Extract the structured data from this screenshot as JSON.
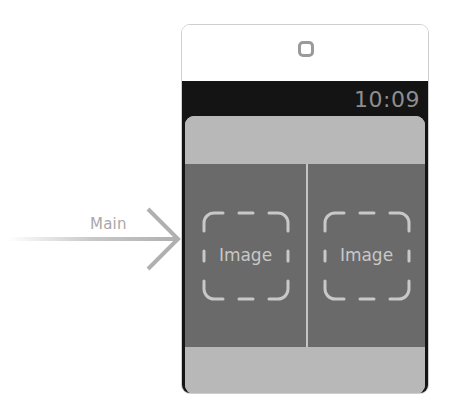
{
  "storyboard": {
    "entry_point": {
      "label": "Main",
      "icon": "entry-arrow-icon"
    },
    "interface_controller": {
      "scene_icon": "interface-controller-icon",
      "status_bar": {
        "time": "10:09"
      },
      "group": {
        "images": [
          {
            "label": "Image",
            "icon": "image-placeholder-icon"
          },
          {
            "label": "Image",
            "icon": "image-placeholder-icon"
          }
        ]
      }
    }
  },
  "colors": {
    "screen_background": "#141414",
    "group_background": "#b8b8b8",
    "image_row_background": "#6a6a6a",
    "placeholder_stroke": "#c8c8c8",
    "time_text": "#8e8e8e",
    "entry_arrow": "#b0b0b0"
  }
}
